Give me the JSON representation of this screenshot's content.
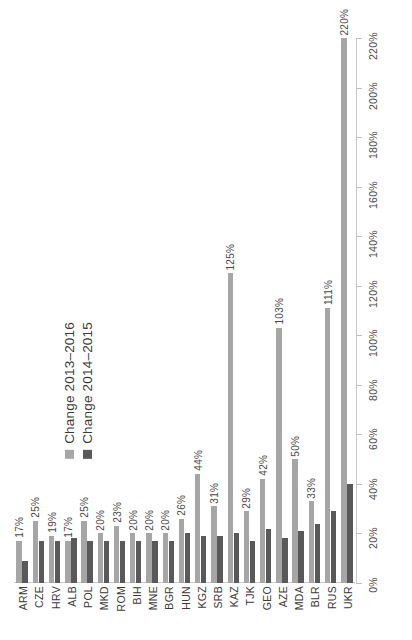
{
  "chart_data": {
    "type": "bar",
    "title": "",
    "subtitle": "",
    "xlabel": "",
    "ylabel": "",
    "ylim": [
      0,
      220
    ],
    "ytick_step": 20,
    "ytick_labels": [
      "0%",
      "20%",
      "40%",
      "60%",
      "80%",
      "100%",
      "120%",
      "140%",
      "160%",
      "180%",
      "200%",
      "220%"
    ],
    "grid": false,
    "legend_position": "top-left",
    "orientation": "vertical",
    "categories": [
      "ARM",
      "CZE",
      "HRV",
      "ALB",
      "POL",
      "MKD",
      "ROM",
      "BIH",
      "MNE",
      "BGR",
      "HUN",
      "KGZ",
      "SRB",
      "KAZ",
      "TJK",
      "GEO",
      "AZE",
      "MDA",
      "BLR",
      "RUS",
      "UKR"
    ],
    "series": [
      {
        "name": "Change 2013–2016",
        "color": "#a6a6a6",
        "values": [
          17,
          25,
          19,
          17,
          25,
          20,
          23,
          20,
          20,
          20,
          26,
          44,
          31,
          125,
          29,
          42,
          103,
          50,
          33,
          111,
          220
        ],
        "data_labels": [
          "17%",
          "25%",
          "19%",
          "17%",
          "25%",
          "20%",
          "23%",
          "20%",
          "20%",
          "20%",
          "26%",
          "44%",
          "31%",
          "125%",
          "29%",
          "42%",
          "103%",
          "50%",
          "33%",
          "111%",
          "220%"
        ]
      },
      {
        "name": "Change 2014–2015",
        "color": "#595959",
        "values": [
          9,
          17,
          17,
          18,
          17,
          17,
          17,
          17,
          17,
          17,
          20,
          19,
          19,
          20,
          17,
          22,
          18,
          21,
          24,
          29,
          40
        ],
        "data_labels": []
      }
    ]
  },
  "legend": {
    "entries": [
      {
        "label": "Change 2013–2016",
        "color": "#a6a6a6"
      },
      {
        "label": "Change 2014–2015",
        "color": "#595959"
      }
    ]
  },
  "axis": {
    "y_ticks": [
      "0%",
      "20%",
      "40%",
      "60%",
      "80%",
      "100%",
      "120%",
      "140%",
      "160%",
      "180%",
      "200%",
      "220%"
    ]
  },
  "colors": {
    "series_light": "#a6a6a6",
    "series_dark": "#595959",
    "axis_line": "#c8c8c8",
    "text": "#3a3a3a",
    "background": "#ffffff"
  }
}
